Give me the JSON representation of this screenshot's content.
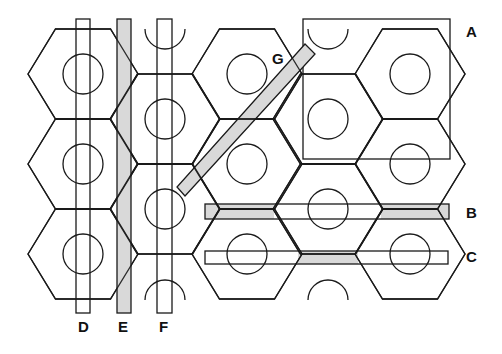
{
  "figure": {
    "labels": {
      "A": "A",
      "B": "B",
      "C": "C",
      "D": "D",
      "E": "E",
      "F": "F",
      "G": "G"
    },
    "elements": [
      {
        "id": "A",
        "kind": "square-window",
        "shaded": false
      },
      {
        "id": "B",
        "kind": "horizontal-strip",
        "shaded": "partial"
      },
      {
        "id": "C",
        "kind": "horizontal-strip",
        "shaded": "partial"
      },
      {
        "id": "D",
        "kind": "vertical-strip",
        "shaded": false
      },
      {
        "id": "E",
        "kind": "vertical-strip",
        "shaded": true
      },
      {
        "id": "F",
        "kind": "vertical-strip",
        "shaded": false
      },
      {
        "id": "G",
        "kind": "diagonal-strip",
        "shaded": true
      }
    ],
    "colors": {
      "line": "#1a1a1a",
      "shade": "#d9d9d9",
      "background": "#ffffff"
    }
  }
}
